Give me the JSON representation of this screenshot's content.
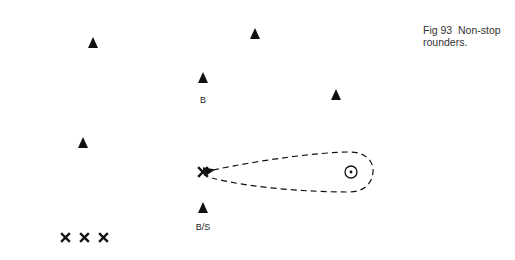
{
  "caption": {
    "figure": "Fig 93",
    "title": "Non-stop rounders.",
    "line1": "Fig 93  Non-stop",
    "line2": "rounders."
  },
  "fielders": [
    {
      "id": "fielder-1",
      "x": 93,
      "y": 43
    },
    {
      "id": "fielder-2",
      "x": 255,
      "y": 34
    },
    {
      "id": "fielder-3",
      "x": 336,
      "y": 95
    },
    {
      "id": "fielder-4",
      "x": 83,
      "y": 143
    }
  ],
  "bowler": {
    "x": 203,
    "y": 79,
    "label": "B"
  },
  "backstop": {
    "x": 203,
    "y": 208,
    "label": "B/S"
  },
  "batter": {
    "x": 203,
    "y": 172,
    "symbol": "×"
  },
  "waiting_batters": {
    "symbols": [
      "×",
      "×",
      "×"
    ],
    "y": 237,
    "xs": [
      65,
      84,
      103
    ]
  },
  "post": {
    "x": 351,
    "y": 172,
    "r": 6
  },
  "legend": {
    "triangle": "fielder",
    "cross": "batter",
    "circle-dot": "post / base"
  },
  "colors": {
    "ink": "#111111",
    "background": "#ffffff"
  }
}
